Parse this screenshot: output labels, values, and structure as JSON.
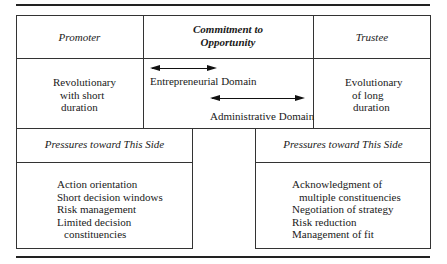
{
  "header": {
    "promoter": "Promoter",
    "commitment_line1": "Commitment to",
    "commitment_line2": "Opportunity",
    "trustee": "Trustee"
  },
  "row": {
    "promoter_lines": [
      "Revolutionary",
      "with short",
      "duration"
    ],
    "domains": {
      "entrepreneurial": "Entrepreneurial Domain",
      "administrative": "Administrative Domain"
    },
    "trustee_lines": [
      "Evolutionary",
      "of long",
      "duration"
    ]
  },
  "pressures": {
    "left": {
      "title": "Pressures toward This Side",
      "items": [
        "Action orientation",
        "Short decision windows",
        "Risk management",
        "Limited decision",
        "constituencies"
      ]
    },
    "right": {
      "title": "Pressures toward This Side",
      "items": [
        "Acknowledgment of",
        "multiple constituencies",
        "Negotiation of strategy",
        "Risk reduction",
        "Management of fit"
      ]
    }
  }
}
